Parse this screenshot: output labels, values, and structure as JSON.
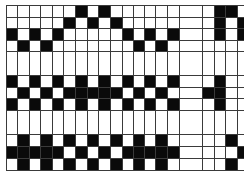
{
  "draft": {
    "colors": {
      "filled": "#0a0a0a",
      "empty": "#ffffff",
      "line": "#3a3a3a"
    },
    "column_edges": [
      6,
      17,
      29,
      40,
      52,
      63,
      75,
      87,
      98,
      110,
      122,
      133,
      144,
      155,
      167,
      179,
      202,
      214,
      225,
      237,
      249
    ],
    "row_edges": [
      5,
      17,
      28,
      40,
      51,
      75,
      87,
      98,
      110,
      134,
      146,
      158,
      170
    ],
    "rows": [
      "00000010100000000110",
      "00000101010000000101",
      "10101000001010100101",
      "01010000000101000000",
      "00000000000000000000",
      "10101010101010100100",
      "01010111110101001100",
      "10101010101010100100",
      "00000000000000000000",
      "01010101010101000010",
      "11111010101111100001",
      "01010101010101000010"
    ]
  }
}
